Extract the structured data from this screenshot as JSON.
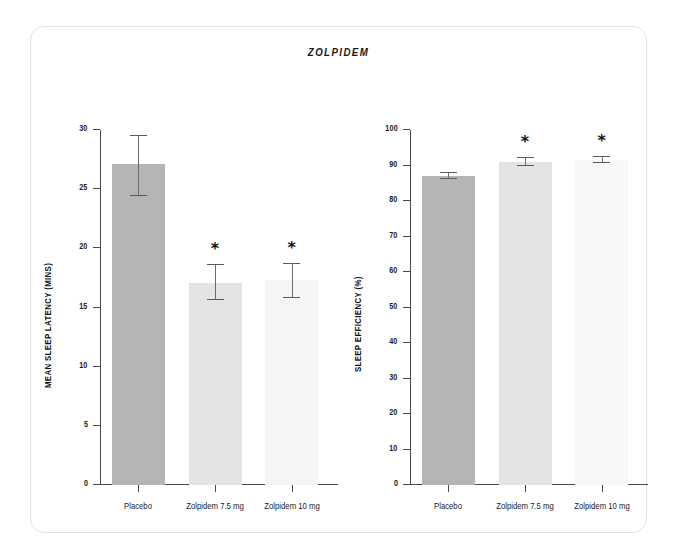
{
  "figure": {
    "title": "ZOLPIDEM",
    "background_color": "#ffffff",
    "frame_color": "#e3e3e3"
  },
  "chart_data": [
    {
      "type": "bar",
      "title": "ZOLPIDEM",
      "panel": "left",
      "categories": [
        "Placebo",
        "Zolpidem 7.5 mg",
        "Zolpidem 10 mg"
      ],
      "values": [
        27.1,
        17.1,
        17.3
      ],
      "errors_upper": [
        29.5,
        18.6,
        18.7
      ],
      "errors_lower": [
        24.4,
        15.6,
        15.8
      ],
      "significance": [
        "",
        "*",
        "*"
      ],
      "bar_colors": [
        "#b5b5b5",
        "#e4e4e4",
        "#f5f5f5"
      ],
      "xlabel": "",
      "ylabel": "MEAN SLEEP LATENCY (MINS)",
      "ylim": [
        0,
        30
      ],
      "yticks": [
        0,
        5,
        10,
        15,
        20,
        25,
        30
      ],
      "ytick_labels": [
        "0",
        "5",
        "10",
        "15",
        "20",
        "25",
        "30"
      ],
      "grid": false,
      "legend": "none"
    },
    {
      "type": "bar",
      "title": "ZOLPIDEM",
      "panel": "right",
      "categories": [
        "Placebo",
        "Zolpidem 7.5 mg",
        "Zolpidem 10 mg"
      ],
      "values": [
        87.1,
        91.1,
        91.6
      ],
      "errors_upper": [
        88.0,
        92.2,
        92.4
      ],
      "errors_lower": [
        86.3,
        90.0,
        90.8
      ],
      "significance": [
        "",
        "*",
        "*"
      ],
      "bar_colors": [
        "#b5b5b5",
        "#e4e4e4",
        "#f8f8f8"
      ],
      "xlabel": "",
      "ylabel": "SLEEP EFFICIENCY (%)",
      "ylim": [
        0,
        100
      ],
      "yticks": [
        0,
        10,
        20,
        30,
        40,
        50,
        60,
        70,
        80,
        90,
        100
      ],
      "ytick_labels": [
        "0",
        "10",
        "20",
        "30",
        "40",
        "50",
        "60",
        "70",
        "80",
        "90",
        "100"
      ],
      "grid": false,
      "legend": "none"
    }
  ]
}
